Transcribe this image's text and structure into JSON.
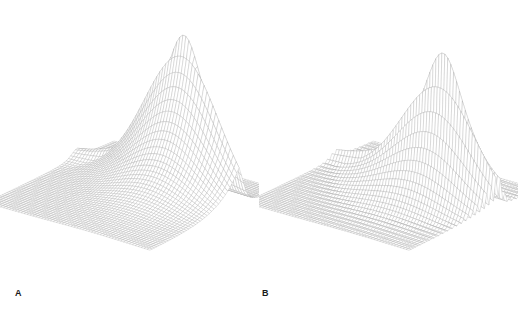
{
  "figure": {
    "background_color": "#ffffff",
    "mesh_line_color": "#aaaaaa",
    "mesh_face_color": "#ffffff",
    "label_color": "#1a1a1a",
    "panels": [
      {
        "id": "a",
        "label": "A"
      },
      {
        "id": "b",
        "label": "B"
      }
    ]
  },
  "chart_data": [
    {
      "type": "surface",
      "panel": "A",
      "title": "",
      "xlabel": "",
      "ylabel": "",
      "zlabel": "",
      "grid": true,
      "legend": "none",
      "render": "wireframe-mesh",
      "mesh_nx": 56,
      "mesh_ny": 56,
      "xlim": [
        -1,
        1
      ],
      "ylim": [
        -1,
        1
      ],
      "zlim": [
        0,
        1
      ],
      "projection": {
        "azimuth_deg": -52,
        "elevation_deg": 26,
        "z_scale": 0.92
      },
      "description": "Non-oscillatory resonance peak: a single sharp pole rising from a flat baseline plane with a smooth decaying basin on the near-left side and a vertical cliff face on the right of the ridge.",
      "function": "lorentzian-pole",
      "peak": {
        "x": 0.42,
        "y": 0.3,
        "z": 1.0
      },
      "peak_screen_xy": [
        201,
        12
      ],
      "baseline_z": 0.0,
      "ridge_axis": "y",
      "oscillatory": false,
      "surface_z": [
        [
          0.0,
          0.0,
          0.0,
          0.0,
          0.0,
          0.0,
          0.0,
          0.0,
          0.0,
          0.0,
          0.0
        ],
        [
          0.0,
          0.0,
          0.0,
          0.0,
          0.0,
          0.01,
          0.01,
          0.02,
          0.02,
          0.01,
          0.0
        ],
        [
          0.0,
          0.0,
          0.0,
          0.01,
          0.01,
          0.02,
          0.03,
          0.05,
          0.04,
          0.02,
          0.0
        ],
        [
          0.0,
          0.0,
          0.01,
          0.01,
          0.02,
          0.04,
          0.07,
          0.12,
          0.09,
          0.03,
          0.0
        ],
        [
          0.0,
          0.01,
          0.01,
          0.02,
          0.04,
          0.07,
          0.14,
          0.28,
          0.18,
          0.05,
          0.0
        ],
        [
          0.0,
          0.01,
          0.02,
          0.03,
          0.06,
          0.12,
          0.26,
          0.58,
          0.3,
          0.07,
          0.0
        ],
        [
          0.0,
          0.01,
          0.02,
          0.04,
          0.08,
          0.17,
          0.4,
          1.0,
          0.42,
          0.09,
          0.0
        ],
        [
          0.0,
          0.01,
          0.02,
          0.03,
          0.06,
          0.12,
          0.26,
          0.58,
          0.3,
          0.07,
          0.0
        ],
        [
          0.0,
          0.01,
          0.01,
          0.02,
          0.04,
          0.07,
          0.14,
          0.28,
          0.18,
          0.05,
          0.0
        ],
        [
          0.0,
          0.0,
          0.01,
          0.01,
          0.02,
          0.04,
          0.07,
          0.12,
          0.09,
          0.03,
          0.0
        ],
        [
          0.0,
          0.0,
          0.0,
          0.0,
          0.01,
          0.01,
          0.02,
          0.03,
          0.02,
          0.01,
          0.0
        ]
      ]
    },
    {
      "type": "surface",
      "panel": "B",
      "title": "",
      "xlabel": "",
      "ylabel": "",
      "zlabel": "",
      "grid": true,
      "legend": "none",
      "render": "wireframe-mesh",
      "mesh_nx": 56,
      "mesh_ny": 56,
      "xlim": [
        -1,
        1
      ],
      "ylim": [
        -1,
        1
      ],
      "zlim": [
        0,
        1
      ],
      "projection": {
        "azimuth_deg": -52,
        "elevation_deg": 26,
        "z_scale": 0.92
      },
      "description": "Oscillatory resonance: same underlying envelope as panel A but modulated by a ringing oscillation, producing a train of decaying spikes and ripples spreading from the main peak across the basin.",
      "function": "lorentzian-pole-with-ringing",
      "peak": {
        "x": 0.42,
        "y": 0.3,
        "z": 1.0
      },
      "peak_screen_xy": [
        412,
        28
      ],
      "baseline_z": 0.0,
      "ridge_axis": "y",
      "oscillatory": true,
      "oscillation_periods": 9,
      "secondary_peak_heights": [
        1.0,
        0.72,
        0.52,
        0.37,
        0.26,
        0.18,
        0.12,
        0.08,
        0.05,
        0.03
      ],
      "surface_z": [
        [
          0.0,
          0.0,
          0.0,
          0.0,
          0.0,
          0.0,
          0.0,
          0.0,
          0.0,
          0.0,
          0.0
        ],
        [
          0.0,
          0.0,
          0.0,
          0.0,
          0.01,
          0.01,
          0.02,
          0.03,
          0.02,
          0.01,
          0.0
        ],
        [
          0.0,
          0.0,
          0.01,
          0.01,
          0.02,
          0.03,
          0.05,
          0.08,
          0.05,
          0.02,
          0.0
        ],
        [
          0.0,
          0.01,
          0.01,
          0.02,
          0.03,
          0.06,
          0.11,
          0.19,
          0.12,
          0.04,
          0.0
        ],
        [
          0.0,
          0.01,
          0.02,
          0.03,
          0.06,
          0.11,
          0.22,
          0.41,
          0.25,
          0.07,
          0.0
        ],
        [
          0.01,
          0.02,
          0.03,
          0.05,
          0.09,
          0.18,
          0.38,
          0.74,
          0.4,
          0.1,
          0.0
        ],
        [
          0.01,
          0.02,
          0.04,
          0.07,
          0.13,
          0.26,
          0.55,
          1.0,
          0.52,
          0.12,
          0.0
        ],
        [
          0.01,
          0.02,
          0.03,
          0.05,
          0.09,
          0.18,
          0.38,
          0.74,
          0.4,
          0.1,
          0.0
        ],
        [
          0.0,
          0.01,
          0.02,
          0.03,
          0.06,
          0.11,
          0.22,
          0.41,
          0.25,
          0.07,
          0.0
        ],
        [
          0.0,
          0.01,
          0.01,
          0.02,
          0.03,
          0.06,
          0.11,
          0.19,
          0.12,
          0.04,
          0.0
        ],
        [
          0.0,
          0.0,
          0.01,
          0.01,
          0.02,
          0.03,
          0.05,
          0.08,
          0.05,
          0.02,
          0.0
        ]
      ]
    }
  ]
}
